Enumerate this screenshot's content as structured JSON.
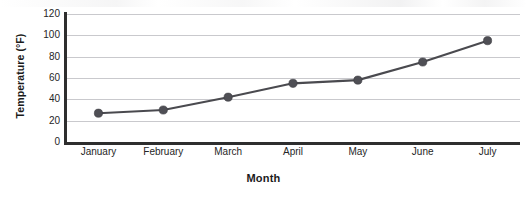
{
  "chart_data": {
    "type": "line",
    "title": "",
    "xlabel": "Month",
    "ylabel": "Temperature (°F)",
    "categories": [
      "January",
      "February",
      "March",
      "April",
      "May",
      "June",
      "July"
    ],
    "values": [
      27,
      30,
      42,
      55,
      58,
      75,
      95
    ],
    "series": [
      {
        "name": "Temperature",
        "values": [
          27,
          30,
          42,
          55,
          58,
          75,
          95
        ]
      }
    ],
    "ylim": [
      0,
      120
    ],
    "ytick_labels": [
      "0",
      "20",
      "40",
      "60",
      "80",
      "100",
      "120"
    ],
    "ytick_values": [
      0,
      20,
      40,
      60,
      80,
      100,
      120
    ],
    "ytick_step": 20,
    "grid": "horizontal",
    "legend": "none",
    "marker": "filled-circle",
    "colors": {
      "line": "#4a4a4f",
      "marker": "#4f4f55",
      "gridline": "#c9c9cd",
      "axis": "#2e2e2e",
      "text": "#262626",
      "title_text": "#1b1b1b",
      "background": "#ffffff"
    }
  },
  "axes": {
    "y_title": "Temperature (°F)",
    "x_title": "Month"
  }
}
